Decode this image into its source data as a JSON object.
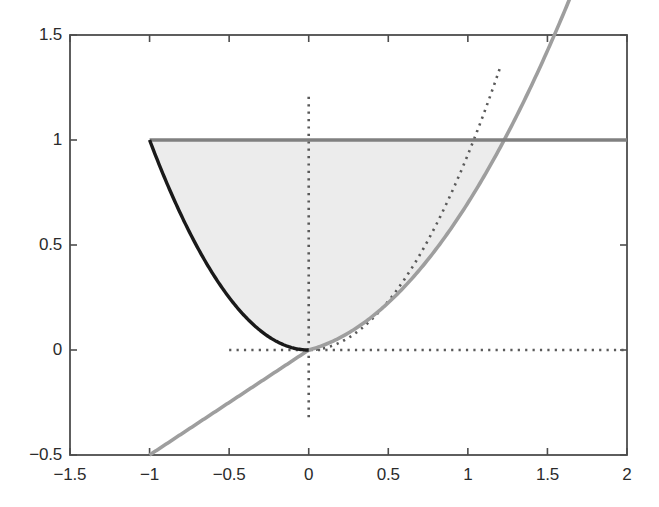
{
  "figure": {
    "background_color": "#ffffff",
    "plot_area": {
      "left_px": 70,
      "top_px": 35,
      "right_px": 627,
      "bottom_px": 455
    },
    "axis_color": "#4d4d4d",
    "title": "",
    "caption": ""
  },
  "chart_data": {
    "type": "line",
    "title": "",
    "subtitle": "",
    "xlabel": "",
    "ylabel": "",
    "xlim": [
      -1.5,
      2
    ],
    "ylim": [
      -0.5,
      1.5
    ],
    "xticks": [
      -1.5,
      -1,
      -0.5,
      0,
      0.5,
      1,
      1.5,
      2
    ],
    "xtick_labels": [
      "−1.5",
      "−1",
      "−0.5",
      "0",
      "0.5",
      "1",
      "1.5",
      "2"
    ],
    "yticks": [
      -0.5,
      0,
      0.5,
      1,
      1.5
    ],
    "ytick_labels": [
      "−0.5",
      "0",
      "0.5",
      "1",
      "1.5"
    ],
    "grid": false,
    "legend": null,
    "legend_position": "none",
    "shaded_region": {
      "name": "feasible-region",
      "fill_color": "#ececec",
      "description": "Region bounded above by y=1 from x=-1 to x=1.571, below by the dark parabola y=x^2 on [-1,0] and by the light-gray curve on [0,1.571]"
    },
    "series": [
      {
        "name": "upper-bound-line",
        "style": "solid",
        "color": "#808080",
        "width_px": 3.4,
        "x": [
          -1,
          -0.5,
          0,
          0.5,
          1,
          1.5,
          2
        ],
        "values": [
          1,
          1,
          1,
          1,
          1,
          1,
          1
        ]
      },
      {
        "name": "dark-parabola",
        "style": "solid",
        "color": "#1a1a1a",
        "width_px": 3.4,
        "x": [
          -1,
          -0.9,
          -0.8,
          -0.7,
          -0.6,
          -0.5,
          -0.4,
          -0.3,
          -0.2,
          -0.1,
          0
        ],
        "values": [
          1,
          0.81,
          0.64,
          0.49,
          0.36,
          0.25,
          0.16,
          0.09,
          0.04,
          0.01,
          0
        ]
      },
      {
        "name": "light-gray-curve",
        "style": "solid",
        "color": "#9e9e9e",
        "width_px": 3.6,
        "x": [
          -1,
          -0.75,
          -0.5,
          -0.25,
          0,
          0.25,
          0.5,
          0.75,
          1,
          1.25,
          1.5,
          1.571,
          1.75,
          2
        ],
        "values": [
          -0.5,
          -0.375,
          -0.25,
          -0.125,
          0,
          0.075,
          0.18,
          0.32,
          0.5,
          0.72,
          0.94,
          1.0,
          1.2,
          1.47
        ]
      },
      {
        "name": "dotted-parabola",
        "style": "dotted",
        "color": "#5a5a5a",
        "width_px": 2.6,
        "x": [
          0,
          0.15,
          0.3,
          0.45,
          0.6,
          0.75,
          0.9,
          1.05,
          1.2
        ],
        "values": [
          0,
          0.02,
          0.085,
          0.19,
          0.335,
          0.525,
          0.755,
          1.03,
          1.34
        ]
      },
      {
        "name": "dotted-vertical-axis",
        "style": "dotted",
        "color": "#5a5a5a",
        "width_px": 2.6,
        "x": [
          0,
          0
        ],
        "values": [
          -0.32,
          1.21
        ]
      },
      {
        "name": "dotted-horizontal-axis",
        "style": "dotted",
        "color": "#5a5a5a",
        "width_px": 2.6,
        "x": [
          -0.5,
          2
        ],
        "values": [
          0,
          0
        ]
      }
    ]
  }
}
